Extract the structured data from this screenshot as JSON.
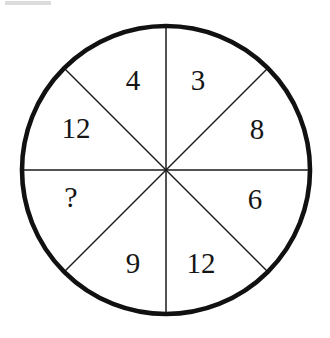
{
  "figure": {
    "shape": "circle",
    "sector_count": 8,
    "colors": {
      "outline": "#111111",
      "spoke": "#1a1a1a",
      "background": "#ffffff",
      "text": "#151515",
      "artifact": "#dcdcdc"
    },
    "geometry": {
      "center_x": 166,
      "center_y": 170,
      "radius": 144,
      "outline_width": 4.5,
      "spoke_width": 1.5
    },
    "spokes": [
      {
        "name": "spoke-vertical-top",
        "x1": 166,
        "y1": 26,
        "x2": 166,
        "y2": 170
      },
      {
        "name": "spoke-vertical-bottom",
        "x1": 166,
        "y1": 170,
        "x2": 166,
        "y2": 314
      },
      {
        "name": "spoke-horizontal-left",
        "x1": 22,
        "y1": 170,
        "x2": 166,
        "y2": 170
      },
      {
        "name": "spoke-horizontal-right",
        "x1": 166,
        "y1": 170,
        "x2": 310,
        "y2": 170
      },
      {
        "name": "spoke-diagonal-upper-left",
        "x1": 64,
        "y1": 68,
        "x2": 166,
        "y2": 170
      },
      {
        "name": "spoke-diagonal-upper-right",
        "x1": 166,
        "y1": 170,
        "x2": 268,
        "y2": 68
      },
      {
        "name": "spoke-diagonal-lower-left",
        "x1": 64,
        "y1": 272,
        "x2": 166,
        "y2": 170
      },
      {
        "name": "spoke-diagonal-lower-right",
        "x1": 166,
        "y1": 170,
        "x2": 268,
        "y2": 272
      }
    ],
    "sectors": [
      {
        "name": "sector-top-left",
        "position": "top-left",
        "label": "4",
        "x": 133,
        "y": 80
      },
      {
        "name": "sector-top-right",
        "position": "top-right",
        "label": "3",
        "x": 198,
        "y": 80
      },
      {
        "name": "sector-left-upper",
        "position": "left-upper",
        "label": "12",
        "x": 76,
        "y": 128
      },
      {
        "name": "sector-right-upper",
        "position": "right-upper",
        "label": "8",
        "x": 257,
        "y": 129
      },
      {
        "name": "sector-left-lower",
        "position": "left-lower",
        "label": "?",
        "x": 71,
        "y": 197
      },
      {
        "name": "sector-right-lower",
        "position": "right-lower",
        "label": "6",
        "x": 255,
        "y": 199
      },
      {
        "name": "sector-bottom-left",
        "position": "bottom-left",
        "label": "9",
        "x": 133,
        "y": 263
      },
      {
        "name": "sector-bottom-right",
        "position": "bottom-right",
        "label": "12",
        "x": 201,
        "y": 263
      }
    ]
  }
}
